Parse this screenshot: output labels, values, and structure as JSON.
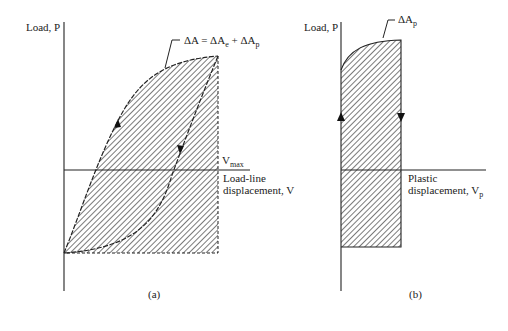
{
  "panel_a": {
    "y_axis_label": "Load, P",
    "x_axis_label_line1": "Load-line",
    "x_axis_label_line2": "displacement, V",
    "vmax_label": "V",
    "vmax_sub": "max",
    "area_label": "ΔA = ΔA",
    "area_sub_e": "e",
    "area_plus": " + ΔA",
    "area_sub_p": "p",
    "caption": "(a)"
  },
  "panel_b": {
    "y_axis_label": "Load, P",
    "x_axis_label_line1": "Plastic",
    "x_axis_label_line2": "displacement, V",
    "x_axis_sub": "p",
    "area_label": "ΔA",
    "area_sub": "p",
    "caption": "(b)"
  },
  "colors": {
    "line": "#222222",
    "hatch": "#333333",
    "background": "#ffffff"
  }
}
